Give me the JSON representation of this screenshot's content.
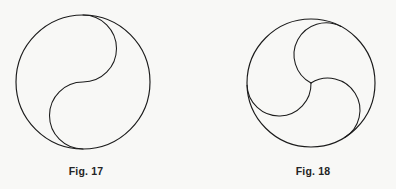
{
  "page": {
    "background_color": "#f8f8f6",
    "ink_color": "#1b1b1b",
    "width": 396,
    "height": 189
  },
  "figures": [
    {
      "id": "fig-17",
      "caption": "Fig. 17",
      "shape_name": "yin-yang-s-curve-circle",
      "description": "Circle divided by an S-shaped curve made of two equal semicircles",
      "circle": {
        "cx": 83,
        "cy": 82,
        "r": 67
      },
      "divider": {
        "type": "s-curve",
        "lobes": 2,
        "lobe_radius": 33.5,
        "top_point": {
          "x": 83,
          "y": 15
        },
        "bottom_point": {
          "x": 83,
          "y": 149
        }
      }
    },
    {
      "id": "fig-18",
      "caption": "Fig. 18",
      "shape_name": "triskelion-three-lobe-circle",
      "description": "Circle divided into three congruent lobes by three arcs meeting at the centre",
      "circle": {
        "cx": 113,
        "cy": 83,
        "r": 64
      },
      "divider": {
        "type": "triskelion",
        "lobes": 3,
        "lobe_radius": 32,
        "center_point": {
          "x": 113,
          "y": 83
        },
        "rotation_degrees": -62
      }
    }
  ]
}
